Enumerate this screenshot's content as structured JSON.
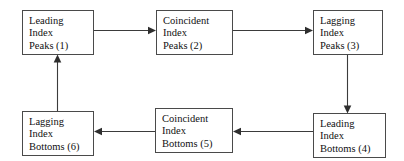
{
  "diagram": {
    "type": "flowchart-cycle",
    "background_color": "#ffffff",
    "box_border_color": "#4a4a4a",
    "line_color": "#3b3b3b",
    "text_color": "#111111",
    "nodes": [
      {
        "id": "leading-index-peaks",
        "number": "1",
        "lines": [
          "Leading",
          "Index",
          "Peaks (1)"
        ],
        "x": 22,
        "y": 10,
        "w": 72,
        "h": 45
      },
      {
        "id": "coincident-index-peaks",
        "number": "2",
        "lines": [
          "Coincident",
          "Index",
          "Peaks (2)"
        ],
        "x": 156,
        "y": 10,
        "w": 77,
        "h": 45
      },
      {
        "id": "lagging-index-peaks",
        "number": "3",
        "lines": [
          "Lagging",
          "Index",
          "Peaks (3)"
        ],
        "x": 313,
        "y": 10,
        "w": 70,
        "h": 45
      },
      {
        "id": "leading-index-bottoms",
        "number": "4",
        "lines": [
          "Leading",
          "Index",
          "Bottoms (4)"
        ],
        "x": 313,
        "y": 113,
        "w": 73,
        "h": 45
      },
      {
        "id": "coincident-index-bottoms",
        "number": "5",
        "lines": [
          "Coincident",
          "Index",
          "Bottoms (5)"
        ],
        "x": 155,
        "y": 108,
        "w": 78,
        "h": 45
      },
      {
        "id": "lagging-index-bottoms",
        "number": "6",
        "lines": [
          "Lagging",
          "Index",
          "Bottoms (6)"
        ],
        "x": 22,
        "y": 111,
        "w": 72,
        "h": 45
      }
    ],
    "edges": [
      {
        "id": "edge-1-to-2",
        "from": "leading-index-peaks",
        "to": "coincident-index-peaks",
        "direction": "right"
      },
      {
        "id": "edge-2-to-3",
        "from": "coincident-index-peaks",
        "to": "lagging-index-peaks",
        "direction": "right"
      },
      {
        "id": "edge-3-to-4",
        "from": "lagging-index-peaks",
        "to": "leading-index-bottoms",
        "direction": "down"
      },
      {
        "id": "edge-4-to-5",
        "from": "leading-index-bottoms",
        "to": "coincident-index-bottoms",
        "direction": "left"
      },
      {
        "id": "edge-5-to-6",
        "from": "coincident-index-bottoms",
        "to": "lagging-index-bottoms",
        "direction": "left"
      },
      {
        "id": "edge-6-to-1",
        "from": "lagging-index-bottoms",
        "to": "leading-index-peaks",
        "direction": "up"
      }
    ]
  }
}
